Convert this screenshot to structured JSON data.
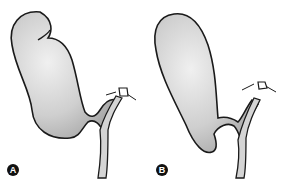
{
  "figure": {
    "panels": [
      {
        "label": "A",
        "description": "gallbladder with folded fundus (Phrygian cap)"
      },
      {
        "label": "B",
        "description": "gallbladder with Hartmann's pouch"
      }
    ],
    "colors": {
      "fill": "#d4d4d4",
      "outline": "#1a1a1a",
      "background": "#ffffff",
      "badge": "#111111"
    }
  }
}
